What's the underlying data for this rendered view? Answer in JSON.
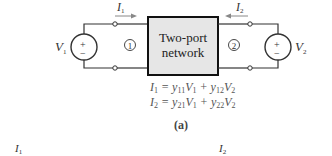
{
  "diagram": {
    "network_label_line1": "Two-port",
    "network_label_line2": "network",
    "port1_label": "1",
    "port2_label": "2",
    "source1": {
      "name": "V",
      "sub": "1",
      "plus": "+",
      "minus": "−"
    },
    "source2": {
      "name": "V",
      "sub": "2",
      "plus": "+",
      "minus": "−"
    },
    "current1": {
      "name": "I",
      "sub": "1"
    },
    "current2": {
      "name": "I",
      "sub": "2"
    },
    "box_fill": "#e6e6e6",
    "equations": [
      {
        "lhs": "I",
        "lhs_sub": "1",
        "t1": "y",
        "t1_sub": "11",
        "v1": "V",
        "v1_sub": "1",
        "t2": "y",
        "t2_sub": "12",
        "v2": "V",
        "v2_sub": "2"
      },
      {
        "lhs": "I",
        "lhs_sub": "2",
        "t1": "y",
        "t1_sub": "21",
        "v1": "V",
        "v1_sub": "1",
        "t2": "y",
        "t2_sub": "22",
        "v2": "V",
        "v2_sub": "2"
      }
    ],
    "caption": "(a)",
    "bottom_labels": [
      {
        "name": "I",
        "sub": "1"
      },
      {
        "name": "I",
        "sub": "2"
      }
    ]
  }
}
